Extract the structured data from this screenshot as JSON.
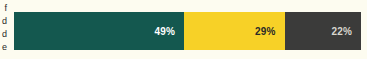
{
  "chart_data": {
    "type": "bar",
    "orientation": "horizontal",
    "stacked": true,
    "title": "",
    "subtitle": "",
    "xlabel": "",
    "ylabel": "",
    "grid": false,
    "legend_position": "none",
    "axis_range": [
      0,
      100
    ],
    "categories": [
      "Share of total"
    ],
    "series": [
      {
        "name": "Segment 1",
        "values": [
          49
        ],
        "label": "49%",
        "color": "#14584f",
        "label_color": "#ffffff"
      },
      {
        "name": "Segment 2",
        "values": [
          29
        ],
        "label": "29%",
        "color": "#f7d127",
        "label_color": "#2a2a28"
      },
      {
        "name": "Segment 3",
        "values": [
          22
        ],
        "label": "22%",
        "color": "#3b3b3a",
        "label_color": "#d8d6cf"
      }
    ]
  },
  "bar": {
    "segments": [
      {
        "value": "49%",
        "percent": 49
      },
      {
        "value": "29%",
        "percent": 29
      },
      {
        "value": "22%",
        "percent": 22
      }
    ]
  },
  "clipped_row_labels": [
    {
      "text": "f"
    },
    {
      "text": "d"
    },
    {
      "text": "d"
    },
    {
      "text": "e"
    }
  ],
  "colors": {
    "background": "#fdfcf0",
    "segment_1": "#14584f",
    "segment_2": "#f7d127",
    "segment_3": "#3b3b3a",
    "label_light": "#ffffff",
    "label_dark": "#2a2a28",
    "label_muted": "#d8d6cf"
  }
}
